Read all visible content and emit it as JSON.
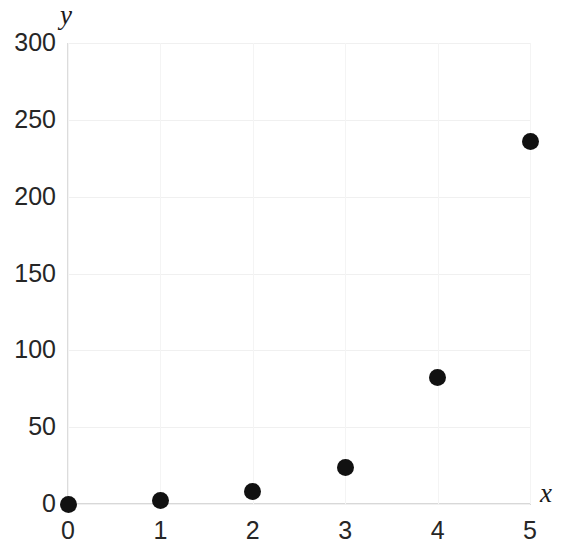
{
  "chart_data": {
    "type": "scatter",
    "title": "",
    "subtitle": "",
    "xlabel": "x",
    "ylabel": "y",
    "x": [
      0,
      1,
      2,
      3,
      4,
      5
    ],
    "values": [
      0,
      2,
      8,
      24,
      82,
      236
    ],
    "series": [
      {
        "name": "",
        "points": [
          {
            "x": 0,
            "y": 0
          },
          {
            "x": 1,
            "y": 2
          },
          {
            "x": 2,
            "y": 8
          },
          {
            "x": 3,
            "y": 24
          },
          {
            "x": 4,
            "y": 82
          },
          {
            "x": 5,
            "y": 236
          }
        ]
      }
    ],
    "xlim": [
      0,
      5
    ],
    "ylim": [
      0,
      300
    ],
    "xticks": [
      "0",
      "1",
      "2",
      "3",
      "4",
      "5"
    ],
    "xtick_values": [
      0,
      1,
      2,
      3,
      4,
      5
    ],
    "yticks": [
      "0",
      "50",
      "100",
      "150",
      "200",
      "250",
      "300"
    ],
    "ytick_values": [
      0,
      50,
      100,
      150,
      200,
      250,
      300
    ],
    "grid": true,
    "legend": "none",
    "marker_color": "#111111",
    "marker_shape": "circle",
    "gridline_color": "#f0f0f0",
    "axis_color": "#d8d8d8",
    "background_color": "#ffffff"
  }
}
